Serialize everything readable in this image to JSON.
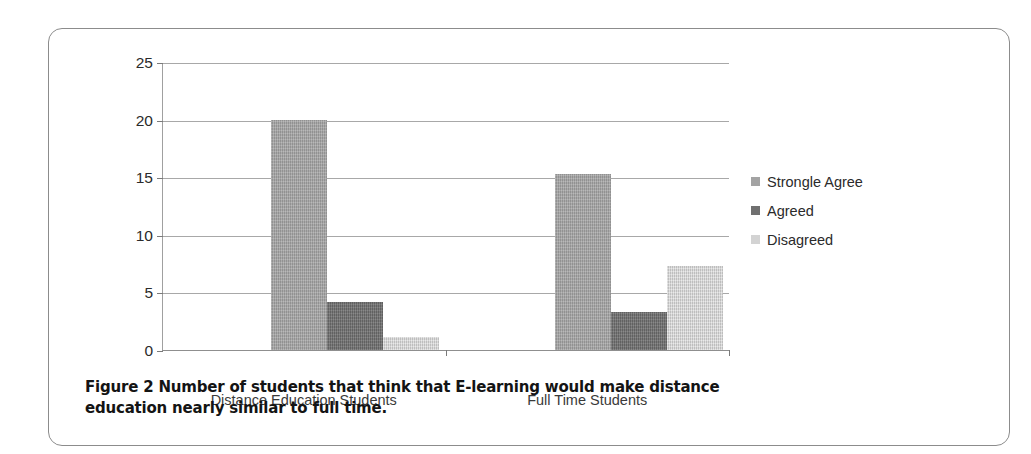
{
  "figure": {
    "caption_label": "Figure 2",
    "caption_text": "Number of students that think that E-learning would make distance education nearly similar to full time."
  },
  "legend": {
    "position": "right",
    "entries": [
      {
        "label": "Strongle Agree",
        "color": "#a3a3a3",
        "swatch_name": "legend-swatch-strongle-agree"
      },
      {
        "label": "Agreed",
        "color": "#707070",
        "swatch_name": "legend-swatch-agreed"
      },
      {
        "label": "Disagreed",
        "color": "#d3d3d3",
        "swatch_name": "legend-swatch-disagreed"
      }
    ]
  },
  "chart_data": {
    "type": "bar",
    "title": "",
    "subtitle": "",
    "xlabel": "",
    "ylabel": "",
    "categories": [
      "Distance Education Students",
      "Full Time Students"
    ],
    "series": [
      {
        "name": "Strongle Agree",
        "color": "#a3a3a3",
        "values": [
          20.0,
          15.3
        ]
      },
      {
        "name": "Agreed",
        "color": "#707070",
        "values": [
          4.2,
          3.3
        ]
      },
      {
        "name": "Disagreed",
        "color": "#d3d3d3",
        "values": [
          1.1,
          7.3
        ]
      }
    ],
    "ylim": [
      0,
      25
    ],
    "yticks": [
      0,
      5,
      10,
      15,
      20,
      25
    ],
    "ytick_labels": [
      "0",
      "5",
      "10",
      "15",
      "20",
      "25"
    ],
    "grid": true,
    "grid_axis": "y",
    "legend_position": "right"
  }
}
